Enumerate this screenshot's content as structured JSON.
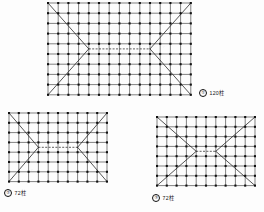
{
  "document": {
    "type": "roof-framing-plan-set",
    "background_color": "#fdfdfd",
    "line_color": "#1a1a1a",
    "node_color": "#111111",
    "ridge_style": "dashed"
  },
  "plans": [
    {
      "id": "plan-1",
      "marker": "①",
      "count_label": "120柱",
      "caption_full": "① 120柱",
      "grid": {
        "cols": 14,
        "rows": 9,
        "cell_w": 10.2,
        "cell_h": 10.2
      },
      "origin": {
        "x": 47,
        "y": 2
      },
      "size": {
        "w": 142.8,
        "h": 81.6
      },
      "ridge": {
        "x1_cell": 4,
        "x2_cell": 10,
        "row_cell": 4.5
      },
      "hip": {
        "left_apex_cell": 4,
        "right_apex_cell": 10
      }
    },
    {
      "id": "plan-2",
      "marker": "②",
      "count_label": "72柱",
      "caption_full": "② 72柱",
      "grid": {
        "cols": 10,
        "rows": 7,
        "cell_w": 9.8,
        "cell_h": 9.8
      },
      "origin": {
        "x": 8,
        "y": 112
      },
      "size": {
        "w": 98,
        "h": 68.6
      },
      "ridge": {
        "x1_cell": 3,
        "x2_cell": 7,
        "row_cell": 3.5
      },
      "hip": {
        "left_apex_cell": 3,
        "right_apex_cell": 7
      }
    },
    {
      "id": "plan-3",
      "marker": "③",
      "count_label": "72柱",
      "caption_full": "③ 72柱",
      "grid": {
        "cols": 10,
        "rows": 7,
        "cell_w": 9.8,
        "cell_h": 9.8
      },
      "origin": {
        "x": 156,
        "y": 116
      },
      "size": {
        "w": 98,
        "h": 68.6
      },
      "ridge": {
        "x1_cell": 4,
        "x2_cell": 6,
        "row_cell": 3.5
      },
      "hip": {
        "left_apex_cell": 4,
        "right_apex_cell": 6
      }
    }
  ],
  "captions": [
    {
      "id": "caption-1",
      "marker": "①",
      "text": "120柱",
      "x": 199,
      "y": 89
    },
    {
      "id": "caption-2",
      "marker": "②",
      "text": "72柱",
      "x": 4,
      "y": 189
    },
    {
      "id": "caption-3",
      "marker": "③",
      "text": "72柱",
      "x": 152,
      "y": 194
    }
  ],
  "chart_data": {
    "type": "diagram",
    "title": "",
    "series": [
      {
        "name": "① 120柱",
        "columns": 120,
        "grid_cols": 15,
        "grid_rows": 10
      },
      {
        "name": "② 72柱",
        "columns": 72,
        "grid_cols": 11,
        "grid_rows": 8
      },
      {
        "name": "③ 72柱",
        "columns": 72,
        "grid_cols": 11,
        "grid_rows": 8
      }
    ],
    "categories": [
      "①",
      "②",
      "③"
    ],
    "values": [
      120,
      72,
      72
    ],
    "ylabel": "柱 (columns)",
    "legend": "none",
    "grid": true
  }
}
